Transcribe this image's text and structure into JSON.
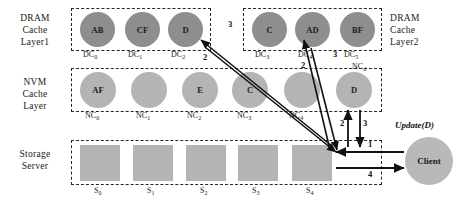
{
  "layers": [
    {
      "id": "dram1",
      "label_lines": [
        "DRAM",
        "Cache",
        "Layer1"
      ]
    },
    {
      "id": "nvm",
      "label_lines": [
        "NVM",
        "Cache",
        "Layer"
      ]
    },
    {
      "id": "storage",
      "label_lines": [
        "Storage",
        "Server"
      ]
    },
    {
      "id": "dram2",
      "label_lines": [
        "DRAM",
        "Cache",
        "Layer2"
      ]
    }
  ],
  "dram_layer1": {
    "nodes": [
      {
        "content": "AB",
        "slot": "DC",
        "slot_sub": "0"
      },
      {
        "content": "CF",
        "slot": "DC",
        "slot_sub": "1"
      },
      {
        "content": "D",
        "slot": "DC",
        "slot_sub": "2"
      }
    ]
  },
  "dram_layer2": {
    "nodes": [
      {
        "content": "C",
        "slot": "DC",
        "slot_sub": "3"
      },
      {
        "content": "AD",
        "slot": "DC",
        "slot_sub": "4"
      },
      {
        "content": "BF",
        "slot": "DC",
        "slot_sub": "5"
      }
    ]
  },
  "nvm_layer": {
    "nodes": [
      {
        "content": "AF",
        "slot": "NC",
        "slot_sub": "0"
      },
      {
        "content": "",
        "slot": "NC",
        "slot_sub": "1"
      },
      {
        "content": "E",
        "slot": "NC",
        "slot_sub": "2"
      },
      {
        "content": "C",
        "slot": "NC",
        "slot_sub": "3"
      },
      {
        "content": "",
        "slot": "NC",
        "slot_sub": "4"
      },
      {
        "content": "D",
        "slot": "NC",
        "slot_sub": "d"
      }
    ]
  },
  "storage_layer": {
    "blocks": [
      {
        "slot": "S",
        "slot_sub": "0"
      },
      {
        "slot": "S",
        "slot_sub": "1"
      },
      {
        "slot": "S",
        "slot_sub": "2"
      },
      {
        "slot": "S",
        "slot_sub": "3"
      },
      {
        "slot": "S",
        "slot_sub": "4"
      }
    ]
  },
  "client": {
    "label": "Client",
    "operation": "Update(D)"
  },
  "step_labels": {
    "s1": "1",
    "s2_left": "2",
    "s3_left": "3",
    "s2_mid": "2",
    "s3_mid": "3",
    "s2_right": "2",
    "s3_right": "3",
    "s4": "4"
  },
  "colors": {
    "dram_node": "#8e8e8e",
    "nvm_node": "#b4b4b4",
    "storage_block": "#b4b4b4",
    "client_node": "#b9b9b9",
    "dash_border": "#262626",
    "text": "#1a1a1a"
  }
}
